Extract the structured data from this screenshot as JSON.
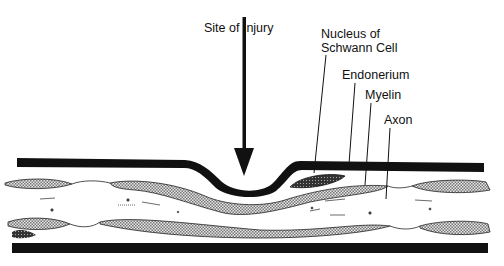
{
  "diagram": {
    "labels": {
      "site_of_injury": "Site of Injury",
      "nucleus_line1": "Nucleus of",
      "nucleus_line2": "Schwann Cell",
      "endonerium": "Endonerium",
      "myelin": "Myelin",
      "axon": "Axon"
    },
    "caption": "",
    "colors": {
      "ink": "#111111",
      "background": "#ffffff",
      "myelin_fill": "#bdbdbd"
    }
  }
}
